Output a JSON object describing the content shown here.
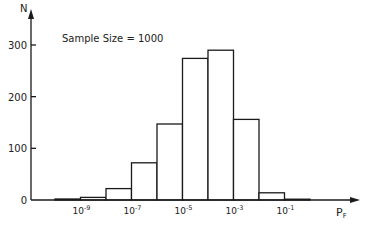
{
  "chart_data": {
    "type": "bar",
    "title": "",
    "annotation": "Sample Size = 1000",
    "xlabel": "P",
    "xlabel_subscript": "F",
    "ylabel": "N",
    "x_scale": "log10",
    "bin_edges_exponent": [
      -10,
      -9,
      -8,
      -7,
      -6,
      -5,
      -4,
      -3,
      -2,
      -1,
      0
    ],
    "categories": [
      "1e-10–1e-9",
      "1e-9–1e-8",
      "1e-8–1e-7",
      "1e-7–1e-6",
      "1e-6–1e-5",
      "1e-5–1e-4",
      "1e-4–1e-3",
      "1e-3–1e-2",
      "1e-2–1e-1",
      "1e-1–1e0"
    ],
    "values": [
      2,
      5,
      22,
      72,
      147,
      274,
      290,
      156,
      14,
      1
    ],
    "x_ticks": [
      {
        "exp": -9,
        "base": "10",
        "sup": "-9"
      },
      {
        "exp": -7,
        "base": "10",
        "sup": "-7"
      },
      {
        "exp": -5,
        "base": "10",
        "sup": "-5"
      },
      {
        "exp": -3,
        "base": "10",
        "sup": "-3"
      },
      {
        "exp": -1,
        "base": "10",
        "sup": "-1"
      }
    ],
    "y_ticks": [
      0,
      100,
      200,
      300
    ],
    "ylim": [
      0,
      330
    ],
    "grid": false,
    "legend": null
  },
  "labels": {
    "y_axis": "N",
    "x_axis_main": "P",
    "x_axis_sub": "F",
    "annotation": "Sample Size = 1000",
    "y_tick_0": "0",
    "y_tick_100": "100",
    "y_tick_200": "200",
    "y_tick_300": "300"
  }
}
